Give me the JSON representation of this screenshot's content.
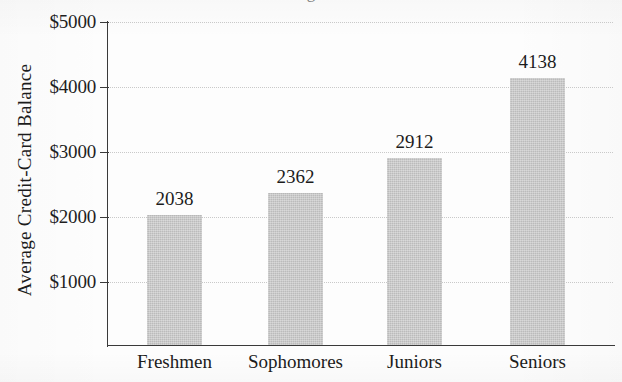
{
  "figure": {
    "title_fragment": "g",
    "background_color": "#fdfdfd",
    "bar_color": "#c3c3c3",
    "axis_color": "#3a3a3a",
    "gridline_color": "#c9c9c9"
  },
  "chart_data": {
    "type": "bar",
    "title": "",
    "xlabel": "",
    "ylabel": "Average Credit-Card Balance",
    "categories": [
      "Freshmen",
      "Sophomores",
      "Juniors",
      "Seniors"
    ],
    "values": [
      2038,
      2362,
      2912,
      4138
    ],
    "value_labels": [
      "2038",
      "2362",
      "2912",
      "4138"
    ],
    "ytick_values": [
      1000,
      2000,
      3000,
      4000,
      5000
    ],
    "ytick_labels": [
      "$1000",
      "$2000",
      "$3000",
      "$4000",
      "$5000"
    ],
    "ylim": [
      0,
      5000
    ],
    "grid": true,
    "grid_style": "dotted-horizontal",
    "legend": null,
    "legend_position": "none",
    "orientation": "vertical"
  }
}
